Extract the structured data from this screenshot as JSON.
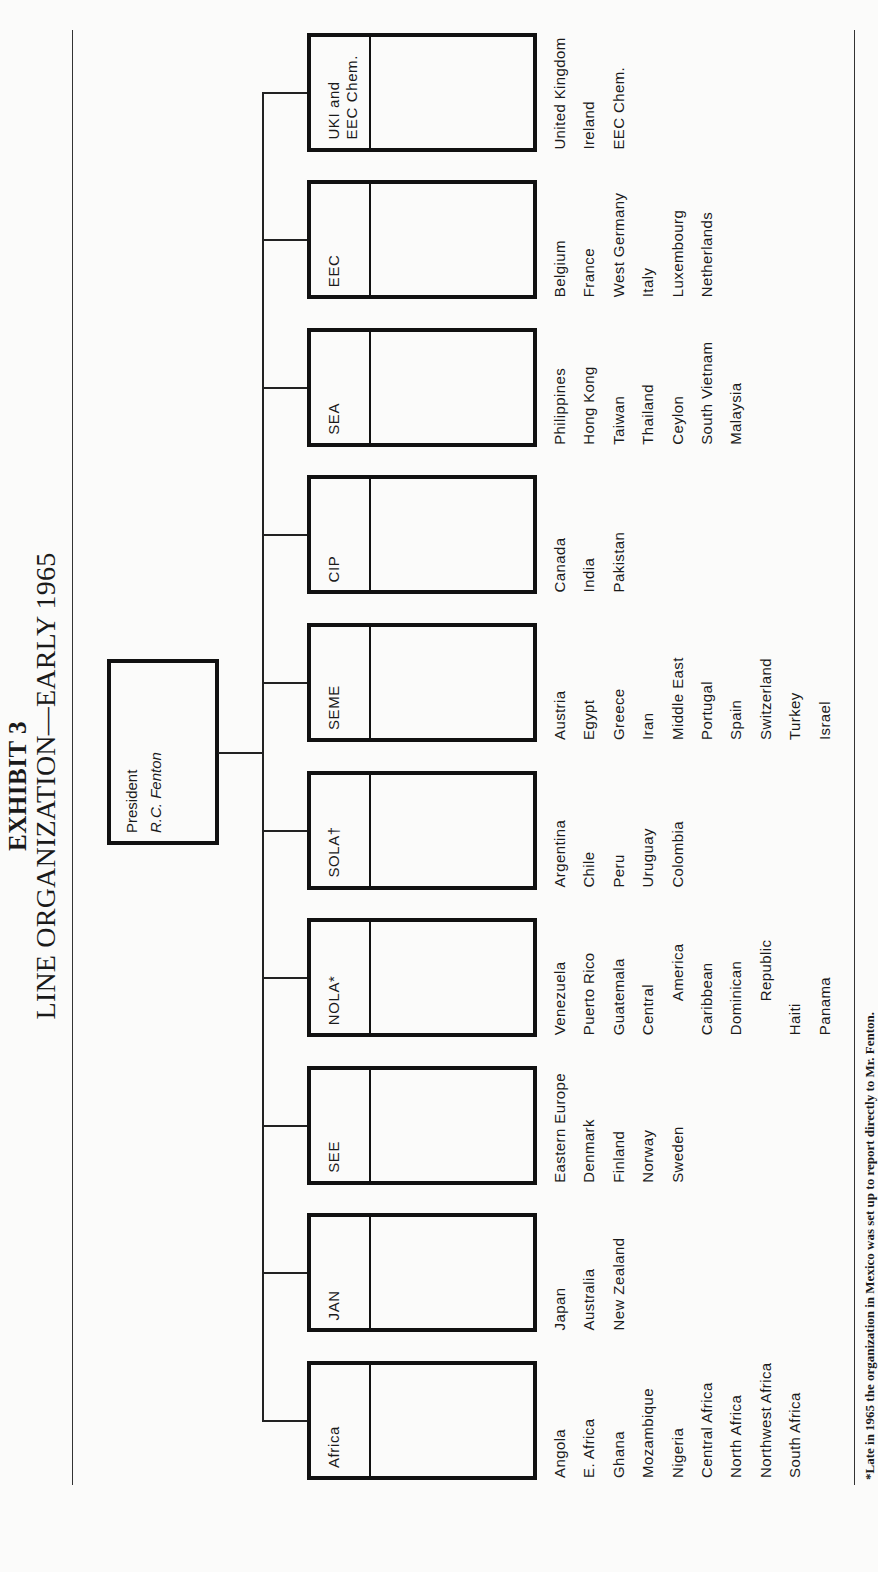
{
  "header": {
    "exhibit": "EXHIBIT 3",
    "title": "LINE ORGANIZATION—EARLY 1965"
  },
  "president": {
    "role": "President",
    "name": "R.C. Fenton"
  },
  "units": [
    {
      "label": "Africa",
      "countries": [
        "Angola",
        "E. Africa",
        "Ghana",
        "Mozambique",
        "Nigeria",
        "Central Africa",
        "North Africa",
        "Northwest Africa",
        "South Africa"
      ]
    },
    {
      "label": "JAN",
      "countries": [
        "Japan",
        "Australia",
        "New Zealand"
      ]
    },
    {
      "label": "SEE",
      "countries": [
        "Eastern Europe",
        "Denmark",
        "Finland",
        "Norway",
        "Sweden"
      ]
    },
    {
      "label": "NOLA*",
      "countries": [
        "Venezuela",
        "Puerto Rico",
        "Guatemala",
        "Central",
        "America",
        "Caribbean",
        "Dominican",
        "Republic",
        "Haiti",
        "Panama"
      ]
    },
    {
      "label": "SOLA†",
      "countries": [
        "Argentina",
        "Chile",
        "Peru",
        "Uruguay",
        "Colombia"
      ]
    },
    {
      "label": "SEME",
      "countries": [
        "Austria",
        "Egypt",
        "Greece",
        "Iran",
        "Middle East",
        "Portugal",
        "Spain",
        "Switzerland",
        "Turkey",
        "Israel"
      ]
    },
    {
      "label": "CIP",
      "countries": [
        "Canada",
        "India",
        "Pakistan"
      ]
    },
    {
      "label": "SEA",
      "countries": [
        "Philippines",
        "Hong Kong",
        "Taiwan",
        "Thailand",
        "Ceylon",
        "South Vietnam",
        "Malaysia"
      ]
    },
    {
      "label": "EEC",
      "countries": [
        "Belgium",
        "France",
        "West Germany",
        "Italy",
        "Luxembourg",
        "Netherlands"
      ]
    },
    {
      "label": "UKI and\nEEC Chem.",
      "countries": [
        "United Kingdom",
        "Ireland",
        "EEC Chem."
      ]
    }
  ],
  "footnote": "*Late in 1965 the organization in Mexico was set up to report directly to Mr. Fenton."
}
